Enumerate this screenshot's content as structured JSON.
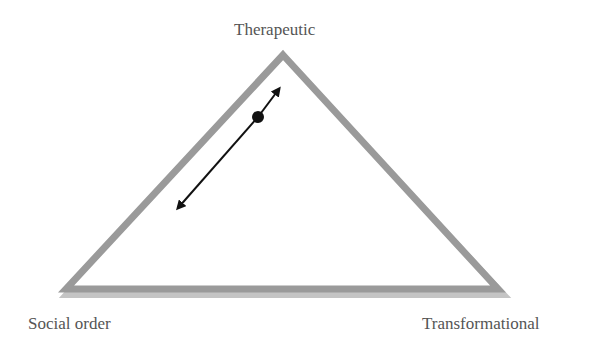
{
  "diagram": {
    "type": "triangle",
    "vertices": {
      "top": {
        "label": "Therapeutic"
      },
      "bottom_left": {
        "label": "Social order"
      },
      "bottom_right": {
        "label": "Transformational"
      }
    },
    "edge_color": "#999999",
    "edge_shadow_color": "#bbbbbb",
    "arrow": {
      "description": "double-headed arrow parallel to left edge with a dot marker near the Therapeutic end",
      "color": "#111111"
    }
  }
}
